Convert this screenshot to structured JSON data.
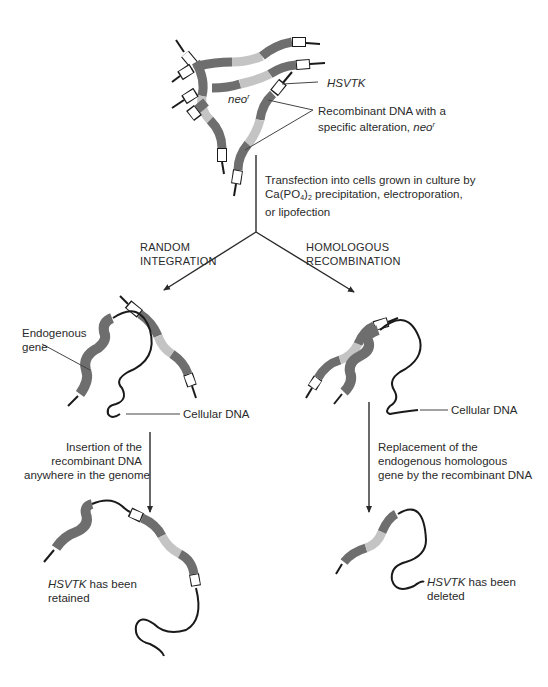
{
  "colors": {
    "dark_segment": "#6e6e6e",
    "light_segment": "#c4c4c4",
    "end_cap": "#ffffff",
    "dna_line": "#1a1a1a",
    "arrow": "#2a2a2a"
  },
  "top": {
    "hsvtk_label": "HSVTK",
    "neo_label": "neo",
    "neo_sup": "r",
    "recombinant_line1": "Recombinant DNA with a",
    "recombinant_line2_prefix": "specific alteration, ",
    "recombinant_line2_italic": "neo",
    "recombinant_line2_sup": "r"
  },
  "transfection": {
    "line1": "Transfection into cells grown in culture by",
    "line2_a": "Ca(PO",
    "line2_sub1": "4",
    "line2_b": ")",
    "line2_sub2": "2",
    "line2_c": " precipitation, electroporation,",
    "line3": "or lipofection"
  },
  "branches": {
    "left": {
      "line1": "RANDOM",
      "line2": "INTEGRATION"
    },
    "right": {
      "line1": "HOMOLOGOUS",
      "line2": "RECOMBINATION"
    }
  },
  "left_panel": {
    "endogenous_line1": "Endogenous",
    "endogenous_line2": "gene",
    "cellular_dna": "Cellular DNA",
    "step_line1": "Insertion of the",
    "step_line2": "recombinant DNA",
    "step_line3": "anywhere in the genome",
    "result_italic": "HSVTK",
    "result_rest": " has been",
    "result_line2": "retained"
  },
  "right_panel": {
    "cellular_dna": "Cellular DNA",
    "step_line1": "Replacement of the",
    "step_line2": "endogenous homologous",
    "step_line3": "gene by the recombinant DNA",
    "result_italic": "HSVTK",
    "result_rest": " has been",
    "result_line2": "deleted"
  }
}
